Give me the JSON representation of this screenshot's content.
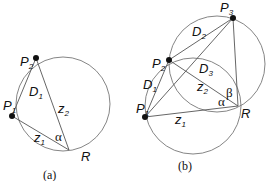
{
  "figure_a": {
    "caption": "(a)",
    "points": {
      "P1": {
        "label": "P",
        "sub": "1"
      },
      "P2": {
        "label": "P",
        "sub": "2"
      },
      "R": {
        "label": "R"
      }
    },
    "segments": {
      "D1": {
        "label": "D",
        "sub": "1"
      },
      "z1": {
        "label": "z",
        "sub": "1"
      },
      "z2": {
        "label": "z",
        "sub": "2"
      }
    },
    "angles": {
      "alpha": "α"
    }
  },
  "figure_b": {
    "caption": "(b)",
    "points": {
      "P1": {
        "label": "P",
        "sub": "1"
      },
      "P2": {
        "label": "P",
        "sub": "2"
      },
      "P3": {
        "label": "P",
        "sub": "3"
      },
      "R": {
        "label": "R"
      }
    },
    "segments": {
      "D1": {
        "label": "D",
        "sub": "1"
      },
      "D2": {
        "label": "D",
        "sub": "2"
      },
      "D3": {
        "label": "D",
        "sub": "3"
      },
      "z1": {
        "label": "z",
        "sub": "1"
      },
      "z2": {
        "label": "z",
        "sub": "2"
      }
    },
    "angles": {
      "alpha": "α",
      "beta": "β"
    }
  }
}
